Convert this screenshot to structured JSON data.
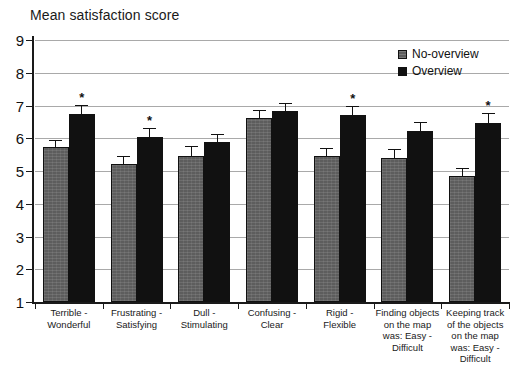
{
  "chart_data": {
    "type": "bar",
    "title": "Mean satisfaction score",
    "xlabel": "",
    "ylabel": "",
    "ylim": [
      1,
      9
    ],
    "yticks": [
      1,
      2,
      3,
      4,
      5,
      6,
      7,
      8,
      9
    ],
    "grid": true,
    "legend_position": "top-right",
    "categories": [
      "Terrible - Wonderful",
      "Frustrating - Satisfying",
      "Dull - Stimulating",
      "Confusing - Clear",
      "Rigid  - Flexible",
      "Finding objects on the map was: Easy - Difficult",
      "Keeping track of the objects on the map was: Easy - Difficult"
    ],
    "category_lines": [
      [
        "Terrible -",
        "Wonderful"
      ],
      [
        "Frustrating -",
        "Satisfying"
      ],
      [
        "Dull -",
        "Stimulating"
      ],
      [
        "Confusing -",
        "Clear"
      ],
      [
        "Rigid  -",
        "Flexible"
      ],
      [
        "Finding objects",
        "on the map",
        "was: Easy -",
        "Difficult"
      ],
      [
        "Keeping track",
        "of the objects",
        "on the map",
        "was: Easy -",
        "Difficult"
      ]
    ],
    "series": [
      {
        "name": "No-overview",
        "color": "#5d5d5d",
        "values": [
          5.72,
          5.2,
          5.45,
          6.62,
          5.46,
          5.41,
          4.84
        ],
        "errors": [
          0.22,
          0.25,
          0.3,
          0.25,
          0.24,
          0.26,
          0.25
        ]
      },
      {
        "name": "Overview",
        "color": "#111111",
        "values": [
          6.75,
          6.03,
          5.88,
          6.82,
          6.72,
          6.22,
          6.46
        ],
        "errors": [
          0.28,
          0.28,
          0.25,
          0.25,
          0.28,
          0.28,
          0.3
        ]
      }
    ],
    "significance_markers": [
      {
        "group": 0,
        "series": 1,
        "symbol": "*"
      },
      {
        "group": 1,
        "series": 1,
        "symbol": "*"
      },
      {
        "group": 4,
        "series": 1,
        "symbol": "*"
      },
      {
        "group": 6,
        "series": 1,
        "symbol": "*"
      }
    ]
  },
  "legend": {
    "items": [
      {
        "label": "No-overview",
        "key": "no-overview"
      },
      {
        "label": "Overview",
        "key": "overview"
      }
    ]
  }
}
